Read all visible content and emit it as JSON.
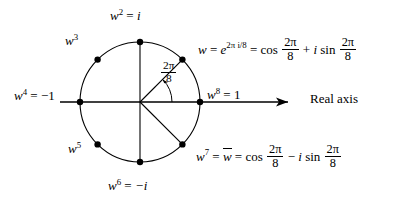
{
  "figure": {
    "circle": {
      "cx": 140,
      "cy": 102,
      "r": 60,
      "stroke": "#000000"
    },
    "axis": {
      "label": "Real axis",
      "x_start": 60,
      "x_end": 300,
      "y": 102,
      "arrow": "right-arrowhead"
    },
    "angle_annotation": {
      "numerator": "2π",
      "denominator": "8",
      "arc_from_deg": 0,
      "arc_to_deg": 45
    },
    "points": [
      {
        "name": "w",
        "label_plain": "w = e^(2πi/8) = cos 2π/8 + i sin 2π/8",
        "angle_deg": 45,
        "x": 182,
        "y": 60
      },
      {
        "name": "w2",
        "label_plain": "w² = i",
        "angle_deg": 90,
        "x": 140,
        "y": 42
      },
      {
        "name": "w3",
        "label_plain": "w³",
        "angle_deg": 135,
        "x": 98,
        "y": 60
      },
      {
        "name": "w4",
        "label_plain": "w⁴ = −1",
        "angle_deg": 180,
        "x": 80,
        "y": 102
      },
      {
        "name": "w5",
        "label_plain": "w⁵",
        "angle_deg": 225,
        "x": 98,
        "y": 144
      },
      {
        "name": "w6",
        "label_plain": "w⁶ = −i",
        "angle_deg": 270,
        "x": 140,
        "y": 162
      },
      {
        "name": "w7",
        "label_plain": "w⁷ = w̄ = cos 2π/8 − i sin 2π/8",
        "angle_deg": 315,
        "x": 182,
        "y": 144
      },
      {
        "name": "w8",
        "label_plain": "w⁸ = 1",
        "angle_deg": 0,
        "x": 200,
        "y": 102
      }
    ],
    "spokes": [
      {
        "to": "w",
        "description": "radius from center to w"
      },
      {
        "to": "w7",
        "description": "radius from center to w7"
      },
      {
        "to": "w2",
        "description": "vertical diameter upper half"
      },
      {
        "to": "w6",
        "description": "vertical diameter lower half"
      }
    ]
  },
  "labels": {
    "w2": {
      "var": "w",
      "exp": "2",
      "eq": "=",
      "val": "i"
    },
    "w3": {
      "var": "w",
      "exp": "3"
    },
    "w4": {
      "var": "w",
      "exp": "4",
      "eq": "=",
      "val": "−1"
    },
    "w5": {
      "var": "w",
      "exp": "5"
    },
    "w6": {
      "var": "w",
      "exp": "6",
      "eq": "=",
      "val": "−i"
    },
    "w8": {
      "var": "w",
      "exp": "8",
      "eq": "=",
      "val": "1"
    },
    "angle": {
      "num": "2π",
      "den": "8"
    },
    "real_axis": "Real axis",
    "w_formula": {
      "var": "w",
      "eq1": "=",
      "base": "e",
      "exponent": "2π i/8",
      "eq2": "=",
      "cos": "cos",
      "num1": "2π",
      "den1": "8",
      "plus": "+",
      "i": "i",
      "sin": "sin",
      "num2": "2π",
      "den2": "8"
    },
    "w7_formula": {
      "var": "w",
      "exp": "7",
      "eq1": "=",
      "conj": "w",
      "eq2": "=",
      "cos": "cos",
      "num1": "2π",
      "den1": "8",
      "minus": "−",
      "i": "i",
      "sin": "sin",
      "num2": "2π",
      "den2": "8"
    }
  }
}
